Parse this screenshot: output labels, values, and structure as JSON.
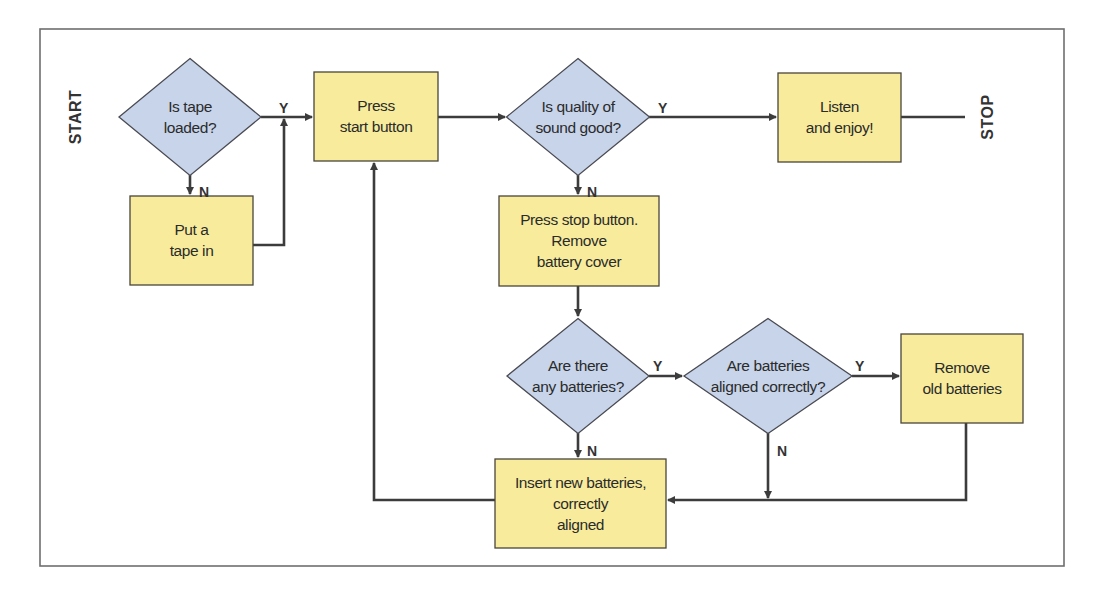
{
  "diagram": {
    "type": "flowchart",
    "frame": {
      "x": 40,
      "y": 29,
      "width": 1024,
      "height": 537
    },
    "colors": {
      "process_fill": "#f8ec9c",
      "decision_fill": "#c7d4ea",
      "line": "#3c3c3c",
      "frame": "#6e6e6e"
    },
    "terminals": {
      "start": {
        "label": "START",
        "x": 75,
        "y": 117
      },
      "stop": {
        "label": "STOP",
        "x": 987,
        "y": 117
      }
    },
    "nodes": [
      {
        "id": "tape_loaded",
        "kind": "decision",
        "cx": 190,
        "cy": 117,
        "w": 142,
        "h": 117,
        "lines": [
          "Is tape",
          "loaded?"
        ]
      },
      {
        "id": "put_tape",
        "kind": "process",
        "x": 130,
        "y": 196,
        "w": 123,
        "h": 89,
        "lines": [
          "Put a",
          "tape in"
        ]
      },
      {
        "id": "press_start",
        "kind": "process",
        "x": 314,
        "y": 72,
        "w": 124,
        "h": 89,
        "lines": [
          "Press",
          "start button"
        ]
      },
      {
        "id": "sound_good",
        "kind": "decision",
        "cx": 578,
        "cy": 117,
        "w": 143,
        "h": 117,
        "lines": [
          "Is quality of",
          "sound good?"
        ]
      },
      {
        "id": "listen",
        "kind": "process",
        "x": 778,
        "y": 73,
        "w": 123,
        "h": 89,
        "lines": [
          "Listen",
          "and enjoy!"
        ]
      },
      {
        "id": "press_stop",
        "kind": "process",
        "x": 499,
        "y": 196,
        "w": 160,
        "h": 90,
        "lines": [
          "Press stop button.",
          "Remove",
          "battery cover"
        ]
      },
      {
        "id": "any_batteries",
        "kind": "decision",
        "cx": 578,
        "cy": 376,
        "w": 142,
        "h": 115,
        "lines": [
          "Are there",
          "any batteries?"
        ]
      },
      {
        "id": "aligned",
        "kind": "decision",
        "cx": 768,
        "cy": 376,
        "w": 168,
        "h": 115,
        "lines": [
          "Are batteries",
          "aligned correctly?"
        ]
      },
      {
        "id": "remove_old",
        "kind": "process",
        "x": 901,
        "y": 334,
        "w": 122,
        "h": 89,
        "lines": [
          "Remove",
          "old batteries"
        ]
      },
      {
        "id": "insert_new",
        "kind": "process",
        "x": 495,
        "y": 459,
        "w": 171,
        "h": 89,
        "lines": [
          "Insert new batteries,",
          "correctly",
          "aligned"
        ]
      }
    ],
    "edges": [
      {
        "from": "tape_loaded",
        "to": "press_start",
        "label": "Y",
        "points": [
          [
            261,
            117
          ],
          [
            312,
            117
          ]
        ],
        "arrow": true,
        "label_pos": [
          279,
          108
        ]
      },
      {
        "from": "tape_loaded",
        "to": "put_tape",
        "label": "N",
        "points": [
          [
            190,
            175
          ],
          [
            190,
            194
          ]
        ],
        "arrow": true,
        "label_pos": [
          199,
          192
        ]
      },
      {
        "from": "put_tape",
        "to": "press_start",
        "label": "",
        "points": [
          [
            253,
            245
          ],
          [
            284,
            245
          ],
          [
            284,
            119
          ]
        ],
        "arrow": true
      },
      {
        "from": "press_start",
        "to": "sound_good",
        "label": "",
        "points": [
          [
            438,
            117
          ],
          [
            505,
            117
          ]
        ],
        "arrow": true
      },
      {
        "from": "sound_good",
        "to": "listen",
        "label": "Y",
        "points": [
          [
            649,
            117
          ],
          [
            776,
            117
          ]
        ],
        "arrow": true,
        "label_pos": [
          658,
          108
        ]
      },
      {
        "from": "listen",
        "to": "stop",
        "label": "",
        "points": [
          [
            901,
            117
          ],
          [
            965,
            117
          ]
        ],
        "arrow": false
      },
      {
        "from": "sound_good",
        "to": "press_stop",
        "label": "N",
        "points": [
          [
            578,
            175
          ],
          [
            578,
            194
          ]
        ],
        "arrow": true,
        "label_pos": [
          587,
          192
        ]
      },
      {
        "from": "press_stop",
        "to": "any_batteries",
        "label": "",
        "points": [
          [
            578,
            286
          ],
          [
            578,
            316
          ]
        ],
        "arrow": true
      },
      {
        "from": "any_batteries",
        "to": "aligned",
        "label": "Y",
        "points": [
          [
            649,
            376
          ],
          [
            682,
            376
          ]
        ],
        "arrow": true,
        "label_pos": [
          653,
          366
        ]
      },
      {
        "from": "any_batteries",
        "to": "insert_new",
        "label": "N",
        "points": [
          [
            578,
            433
          ],
          [
            578,
            457
          ]
        ],
        "arrow": true,
        "label_pos": [
          587,
          451
        ]
      },
      {
        "from": "aligned",
        "to": "remove_old",
        "label": "Y",
        "points": [
          [
            852,
            376
          ],
          [
            899,
            376
          ]
        ],
        "arrow": true,
        "label_pos": [
          855,
          366
        ]
      },
      {
        "from": "aligned",
        "to": "insert_new",
        "label": "N",
        "points": [
          [
            768,
            433
          ],
          [
            768,
            498
          ]
        ],
        "arrow": true,
        "label_pos": [
          777,
          451
        ]
      },
      {
        "from": "remove_old",
        "to": "insert_new",
        "label": "",
        "points": [
          [
            966,
            423
          ],
          [
            966,
            500
          ],
          [
            668,
            500
          ]
        ],
        "arrow": true
      },
      {
        "from": "insert_new",
        "to": "press_start",
        "label": "",
        "points": [
          [
            495,
            500
          ],
          [
            374,
            500
          ],
          [
            374,
            163
          ]
        ],
        "arrow": true
      }
    ]
  }
}
